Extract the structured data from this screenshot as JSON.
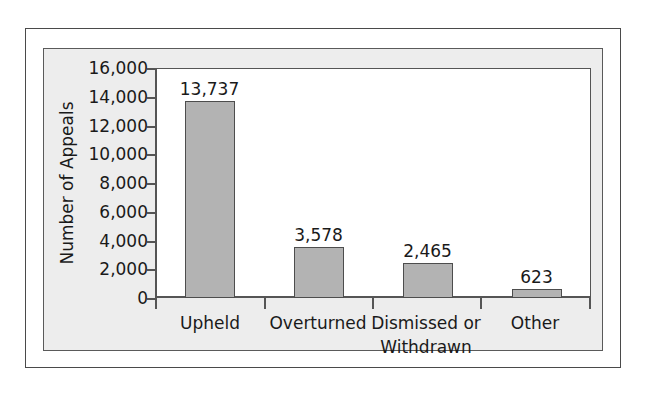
{
  "chart_data": {
    "type": "bar",
    "title": "",
    "xlabel": "",
    "ylabel": "Number of Appeals",
    "categories": [
      "Upheld",
      "Overturned",
      "Dismissed or Withdrawn",
      "Other"
    ],
    "category_lines": [
      [
        "Upheld"
      ],
      [
        "Overturned"
      ],
      [
        "Dismissed or",
        "Withdrawn"
      ],
      [
        "Other"
      ]
    ],
    "values": [
      13737,
      3578,
      2465,
      623
    ],
    "value_labels": [
      "13,737",
      "3,578",
      "2,465",
      "623"
    ],
    "ylim": [
      0,
      16000
    ],
    "ytick_values": [
      0,
      2000,
      4000,
      6000,
      8000,
      10000,
      12000,
      14000,
      16000
    ],
    "ytick_labels": [
      "0",
      "2,000",
      "4,000",
      "6,000",
      "8,000",
      "10,000",
      "12,000",
      "14,000",
      "16,000"
    ],
    "grid": false,
    "legend": null,
    "bar_color": "#b3b3b3",
    "bar_border_color": "#4d4d4d",
    "plot_background": "#ffffff",
    "panel_background": "#ededed",
    "text_color": "#1a1a1a",
    "axis_color": "#555555"
  }
}
